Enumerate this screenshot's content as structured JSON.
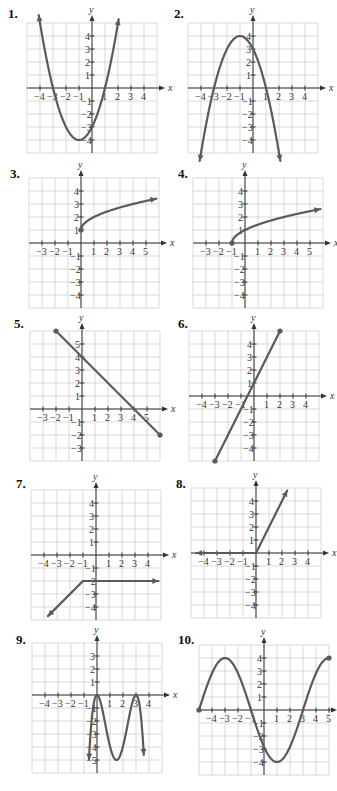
{
  "page": {
    "colors": {
      "curve": "#5a5a5a",
      "grid": "#cfcfcf",
      "axis": "#333333",
      "background": "#ffffff"
    }
  },
  "chart_data": [
    {
      "number": "1.",
      "type": "line",
      "title": "1.",
      "xlabel": "x",
      "ylabel": "y",
      "xticks": [
        "-4",
        "-3",
        "-2",
        "-1",
        "1",
        "2",
        "3",
        "4"
      ],
      "yticks": [
        "4",
        "3",
        "2",
        "1",
        "-1",
        "-2",
        "-3",
        "-4"
      ],
      "xlim": [
        -5,
        5
      ],
      "ylim": [
        -4.5,
        4.8
      ],
      "grid": true,
      "description": "Upward parabola y=(x+1)^2-4, arrows at both ends",
      "points": [
        [
          -4.1,
          5.6
        ],
        [
          -3,
          0
        ],
        [
          -2,
          -3
        ],
        [
          -1,
          -4
        ],
        [
          0,
          -3
        ],
        [
          1,
          0
        ],
        [
          2.0,
          5.0
        ]
      ],
      "x_intercepts": [
        -3,
        1
      ],
      "y_intercept": -3,
      "vertex": [
        -1,
        -4
      ]
    },
    {
      "number": "2.",
      "type": "line",
      "title": "2.",
      "xlabel": "x",
      "ylabel": "y",
      "xticks": [
        "-4",
        "-3",
        "-2",
        "-1",
        "1",
        "2",
        "3",
        "4"
      ],
      "yticks": [
        "4",
        "3",
        "2",
        "1",
        "-1",
        "-2",
        "-3",
        "-4"
      ],
      "xlim": [
        -5,
        5
      ],
      "ylim": [
        -5,
        4.8
      ],
      "grid": true,
      "description": "Downward parabola y=-(x+1)^2+4, arrows at both ends",
      "points": [
        [
          -4,
          -5
        ],
        [
          -3,
          0
        ],
        [
          -2,
          3
        ],
        [
          -1,
          4
        ],
        [
          0,
          3
        ],
        [
          1,
          0
        ],
        [
          2,
          -5
        ]
      ],
      "x_intercepts": [
        -3,
        1
      ],
      "y_intercept": 3,
      "vertex": [
        -1,
        4
      ]
    },
    {
      "number": "3.",
      "type": "line",
      "title": "3.",
      "xlabel": "x",
      "ylabel": "y",
      "xticks": [
        "-3",
        "-2",
        "-1",
        "1",
        "2",
        "3",
        "4",
        "5"
      ],
      "yticks": [
        "4",
        "3",
        "2",
        "1",
        "-1",
        "-2",
        "-3",
        "-4"
      ],
      "xlim": [
        -4,
        6
      ],
      "ylim": [
        -5,
        5
      ],
      "grid": true,
      "description": "Square-root curve y=sqrt(x)+1 starting at closed dot (0,1), arrow to the right",
      "points": [
        [
          0,
          1
        ],
        [
          1,
          2
        ],
        [
          4,
          3
        ],
        [
          5.8,
          3.4
        ]
      ],
      "start_point": [
        0,
        1
      ]
    },
    {
      "number": "4.",
      "type": "line",
      "title": "4.",
      "xlabel": "x",
      "ylabel": "y",
      "xticks": [
        "-3",
        "-2",
        "-1",
        "1",
        "2",
        "3",
        "4",
        "5"
      ],
      "yticks": [
        "4",
        "3",
        "2",
        "1",
        "-1",
        "-2",
        "-3",
        "-4"
      ],
      "xlim": [
        -4,
        6
      ],
      "ylim": [
        -5,
        5
      ],
      "grid": true,
      "description": "Square-root curve y=sqrt(x+1) starting at closed dot (-1,0), arrow to the right",
      "points": [
        [
          -1,
          0
        ],
        [
          0,
          1
        ],
        [
          3,
          2
        ],
        [
          5.8,
          2.6
        ]
      ],
      "start_point": [
        -1,
        0
      ]
    },
    {
      "number": "5.",
      "type": "line",
      "title": "5.",
      "xlabel": "x",
      "ylabel": "y",
      "xticks": [
        "-3",
        "-2",
        "-1",
        "1",
        "2",
        "3",
        "4",
        "5"
      ],
      "yticks": [
        "5",
        "4",
        "3",
        "2",
        "1",
        "-1",
        "-2",
        "-3"
      ],
      "xlim": [
        -4,
        6
      ],
      "ylim": [
        -4,
        6
      ],
      "grid": true,
      "description": "Line segment y=-x+4 with closed endpoints (-2,6) and (6,-2)",
      "points": [
        [
          -2,
          6
        ],
        [
          6,
          -2
        ]
      ],
      "x_intercept": 4,
      "y_intercept": 4
    },
    {
      "number": "6.",
      "type": "line",
      "title": "6.",
      "xlabel": "x",
      "ylabel": "y",
      "xticks": [
        "-4",
        "-3",
        "-2",
        "-1",
        "1",
        "2",
        "3",
        "4"
      ],
      "yticks": [
        "4",
        "3",
        "2",
        "1",
        "-1",
        "-2",
        "-3",
        "-4"
      ],
      "xlim": [
        -5,
        5
      ],
      "ylim": [
        -5,
        5
      ],
      "grid": true,
      "description": "Line segment y=2x+1 with closed endpoints (-3,-5) and (2,5)",
      "points": [
        [
          -3,
          -5
        ],
        [
          2,
          5
        ]
      ],
      "y_intercept": 1
    },
    {
      "number": "7.",
      "type": "line",
      "title": "7.",
      "xlabel": "x",
      "ylabel": "y",
      "xticks": [
        "-4",
        "-3",
        "-2",
        "-1",
        "1",
        "2",
        "3",
        "4"
      ],
      "yticks": [
        "4",
        "3",
        "2",
        "1",
        "-1",
        "-2",
        "-3",
        "-4"
      ],
      "xlim": [
        -5,
        5
      ],
      "ylim": [
        -5,
        5
      ],
      "grid": true,
      "description": "Piecewise: line of slope 1 coming from lower-left (arrow) up to (-1,-2), then horizontal y=-2 to the right with arrow",
      "points": [
        [
          -4.5,
          -5.2
        ],
        [
          -1,
          -2
        ],
        [
          4.8,
          -2
        ]
      ]
    },
    {
      "number": "8.",
      "type": "line",
      "title": "8.",
      "xlabel": "x",
      "ylabel": "y",
      "xticks": [
        "-4",
        "-3",
        "-2",
        "-1",
        "1",
        "2",
        "3",
        "4"
      ],
      "yticks": [
        "4",
        "3",
        "2",
        "1",
        "-1",
        "-2",
        "-3",
        "-4"
      ],
      "xlim": [
        -5,
        5
      ],
      "ylim": [
        -5,
        5
      ],
      "grid": true,
      "description": "Piecewise: y=0 for x<0 (arrow left), y=2x for x>=0 (arrow up-right)",
      "points": [
        [
          -4.8,
          0
        ],
        [
          0,
          0
        ],
        [
          2.4,
          4.8
        ]
      ]
    },
    {
      "number": "9.",
      "type": "line",
      "title": "9.",
      "xlabel": "x",
      "ylabel": "y",
      "xticks": [
        "-4",
        "-3",
        "-2",
        "-1",
        "1",
        "2",
        "3",
        "4"
      ],
      "yticks": [
        "3",
        "2",
        "1",
        "-1",
        "-2",
        "-3",
        "-4",
        "-5"
      ],
      "xlim": [
        -5,
        5
      ],
      "ylim": [
        -6,
        4
      ],
      "grid": true,
      "description": "Curve with local maxima at (0,0) and (3,0), local minimum near (1.5,-5), arrows down at both ends",
      "points": [
        [
          -0.6,
          -5.8
        ],
        [
          0,
          0
        ],
        [
          1.5,
          -5
        ],
        [
          3,
          0
        ],
        [
          3.6,
          -5.8
        ]
      ]
    },
    {
      "number": "10.",
      "type": "line",
      "title": "10.",
      "xlabel": "x",
      "ylabel": "y",
      "xticks": [
        "-4",
        "-3",
        "-2",
        "-1",
        "1",
        "2",
        "3",
        "4",
        "5"
      ],
      "yticks": [
        "4",
        "3",
        "2",
        "1",
        "-1",
        "-2",
        "-3",
        "-4"
      ],
      "xlim": [
        -5,
        5
      ],
      "ylim": [
        -5,
        5
      ],
      "grid": true,
      "description": "Cosine-like wave y=4cos(pi x/4 ... ) with closed endpoints at (-5,0) and (5,0); maxima at x=-4,0,4 (y=4), minima at x=-2,2 (y=-4)",
      "points": [
        [
          -5,
          0
        ],
        [
          -4,
          4
        ],
        [
          -3,
          0
        ],
        [
          -2,
          -4
        ],
        [
          -1,
          0
        ],
        [
          0,
          4
        ],
        [
          1,
          0
        ],
        [
          2,
          -4
        ],
        [
          3,
          0
        ],
        [
          4,
          4
        ],
        [
          5,
          0
        ]
      ]
    }
  ]
}
